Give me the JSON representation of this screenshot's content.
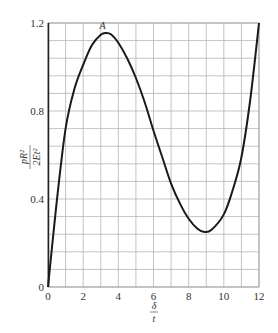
{
  "chart_data": {
    "type": "line",
    "title": "",
    "xlabel": {
      "numerator": "δ",
      "denominator": "t"
    },
    "ylabel": {
      "numerator": "pR²",
      "denominator": "2Et²"
    },
    "xlim": [
      0,
      12
    ],
    "ylim": [
      0,
      1.2
    ],
    "grid": true,
    "x_grid_step": 1,
    "y_grid_step": 0.08,
    "x_ticks": [
      0,
      2,
      4,
      6,
      8,
      10,
      12
    ],
    "x_tick_labels": [
      "0",
      "2",
      "4",
      "6",
      "8",
      "10",
      "12"
    ],
    "y_ticks": [
      0,
      0.4,
      0.8,
      1.2
    ],
    "y_tick_labels": [
      "0",
      "0.4",
      "0.8",
      "1.2"
    ],
    "series": [
      {
        "name": "load-deflection",
        "x": [
          0,
          0.5,
          1,
          1.5,
          2,
          2.5,
          3,
          3.3,
          3.6,
          4,
          4.5,
          5,
          5.5,
          6,
          6.5,
          7,
          7.5,
          8,
          8.5,
          8.9,
          9.3,
          10,
          10.5,
          11,
          11.5,
          12
        ],
        "y": [
          0,
          0.39,
          0.72,
          0.9,
          1.01,
          1.1,
          1.147,
          1.155,
          1.148,
          1.11,
          1.04,
          0.95,
          0.84,
          0.71,
          0.59,
          0.47,
          0.38,
          0.31,
          0.265,
          0.25,
          0.26,
          0.33,
          0.44,
          0.59,
          0.85,
          1.2
        ]
      }
    ],
    "annotations": [
      {
        "text": "A",
        "x": 3.1,
        "y": 1.155
      }
    ]
  }
}
